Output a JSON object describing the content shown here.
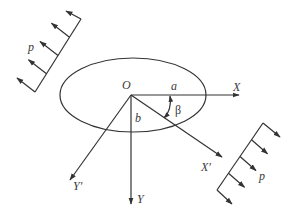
{
  "diagram": {
    "type": "elliptical hole under remote uniform load",
    "colors": {
      "stroke": "#333333",
      "text": "#3a3a3a",
      "background": "#ffffff"
    },
    "labels": {
      "origin": "O",
      "semi_major": "a",
      "semi_minor": "b",
      "angle": "β",
      "x_axis": "X",
      "y_axis": "Y",
      "x_prime_axis": "X′",
      "y_prime_axis": "Y′",
      "load_top_left": "p",
      "load_bottom_right": "p"
    },
    "ellipse": {
      "cx": 133,
      "cy": 95,
      "rx": 73,
      "ry": 37
    },
    "origin_point": {
      "x": 131,
      "y": 95
    },
    "axes": {
      "x": {
        "from": [
          131,
          95
        ],
        "to": [
          239,
          95
        ]
      },
      "y": {
        "from": [
          131,
          95
        ],
        "to": [
          131,
          204
        ]
      },
      "x_prime": {
        "from": [
          131,
          95
        ],
        "to": [
          222,
          157
        ]
      },
      "y_prime": {
        "from": [
          131,
          95
        ],
        "to": [
          70,
          180
        ]
      }
    },
    "loads": {
      "top_left": {
        "base_from": [
          35,
          92
        ],
        "base_to": [
          81,
          19
        ],
        "arrow_count": 5,
        "direction": "up-left"
      },
      "bottom_right": {
        "base_from": [
          217,
          190
        ],
        "base_to": [
          263,
          123
        ],
        "arrow_count": 5,
        "direction": "down-right"
      }
    }
  }
}
